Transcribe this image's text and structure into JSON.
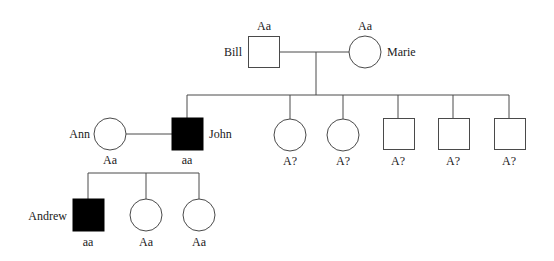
{
  "pedigree": {
    "generation1": {
      "father": {
        "name": "Bill",
        "genotype": "Aa",
        "sex": "male",
        "affected": false
      },
      "mother": {
        "name": "Marie",
        "genotype": "Aa",
        "sex": "female",
        "affected": false
      }
    },
    "generation2": {
      "children": [
        {
          "name": "John",
          "genotype": "aa",
          "sex": "male",
          "affected": true
        },
        {
          "name": "",
          "genotype": "A?",
          "sex": "female",
          "affected": false
        },
        {
          "name": "",
          "genotype": "A?",
          "sex": "female",
          "affected": false
        },
        {
          "name": "",
          "genotype": "A?",
          "sex": "male",
          "affected": false
        },
        {
          "name": "",
          "genotype": "A?",
          "sex": "male",
          "affected": false
        },
        {
          "name": "",
          "genotype": "A?",
          "sex": "male",
          "affected": false
        }
      ],
      "spouse": {
        "name": "Ann",
        "genotype": "Aa",
        "sex": "female",
        "affected": false
      }
    },
    "generation3": {
      "children": [
        {
          "name": "Andrew",
          "genotype": "aa",
          "sex": "male",
          "affected": true
        },
        {
          "name": "",
          "genotype": "Aa",
          "sex": "female",
          "affected": false
        },
        {
          "name": "",
          "genotype": "Aa",
          "sex": "female",
          "affected": false
        }
      ]
    },
    "colors": {
      "line": "#4a4a4a",
      "affected_fill": "#000000",
      "unaffected_fill": "#ffffff"
    }
  }
}
